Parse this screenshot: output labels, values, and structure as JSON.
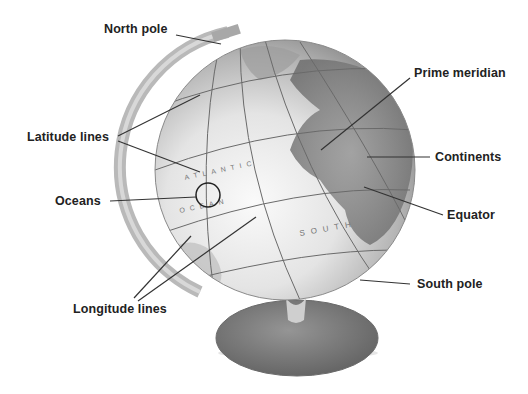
{
  "diagram": {
    "labels": {
      "north_pole": "North pole",
      "latitude_lines": "Latitude lines",
      "oceans": "Oceans",
      "longitude_lines": "Longitude lines",
      "prime_meridian": "Prime meridian",
      "continents": "Continents",
      "equator": "Equator",
      "south_pole": "South pole"
    },
    "globe_text": {
      "ocean_word_1": "ATLANTIC",
      "ocean_word_2": "OCEAN",
      "ocean_word_3": "SOUTH"
    },
    "colors": {
      "line": "#333333",
      "label": "#222222",
      "globe_light": "#eeeeee",
      "globe_dark": "#8a8a8a",
      "base": "#7d7d7d"
    }
  }
}
